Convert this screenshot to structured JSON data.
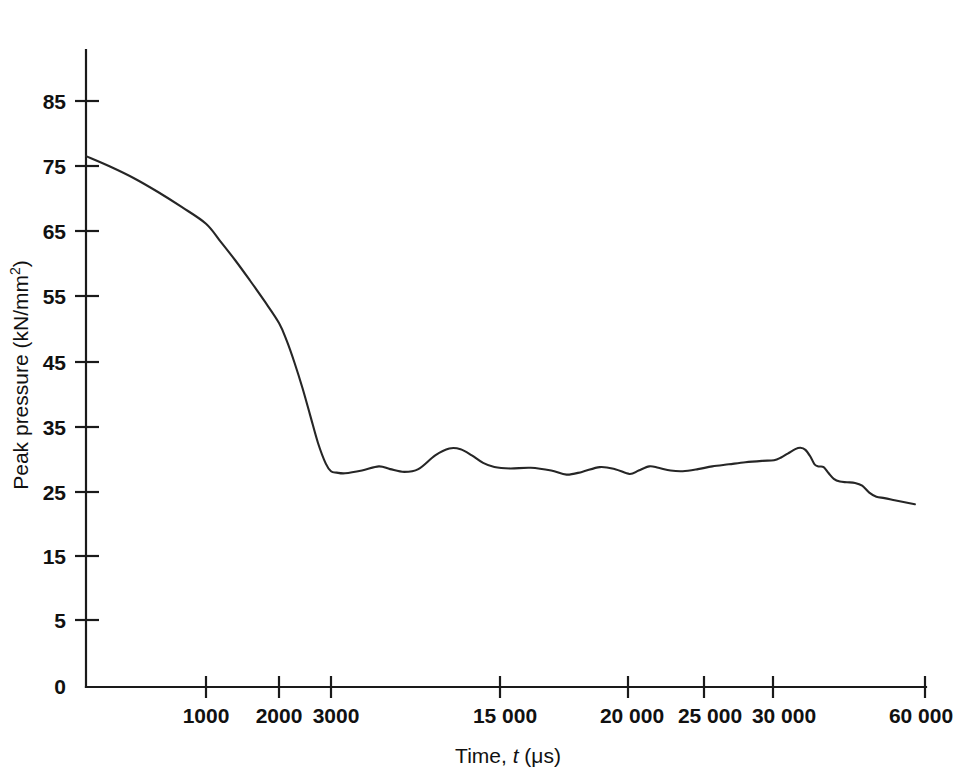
{
  "chart_data": {
    "type": "line",
    "title": "",
    "subtitle": "",
    "xlabel_plain": "Time, ",
    "xlabel_italic": "t",
    "xlabel_unit": " (μs)",
    "xlabel": "Time, t (μs)",
    "ylabel": "Peak pressure (kN/mm²)",
    "ylabel_main": "Peak pressure (kN/mm",
    "ylabel_sup": "2",
    "ylabel_close": ")",
    "grid": false,
    "legend": "none",
    "line_color": "#262626",
    "axis_color": "#1a1a1a",
    "background_color": "#ffffff",
    "xlim": [
      0,
      60000
    ],
    "ylim": [
      0,
      90
    ],
    "x_tick_values": [
      0,
      1000,
      2000,
      3000,
      15000,
      20000,
      25000,
      30000,
      60000
    ],
    "x_tick_labels": [
      "0",
      "1000",
      "2000",
      "3000",
      "15 000",
      "20 000",
      "25 000",
      "30 000",
      "60 000"
    ],
    "y_tick_values": [
      0,
      5,
      15,
      25,
      35,
      45,
      55,
      65,
      75,
      85
    ],
    "y_tick_labels": [
      "0",
      "5",
      "15",
      "25",
      "35",
      "45",
      "55",
      "65",
      "75",
      "85"
    ],
    "x_axis_scale": "piecewise-compressed",
    "series": [
      {
        "name": "Peak pressure decay",
        "points": [
          [
            0,
            77.0
          ],
          [
            200,
            75.5
          ],
          [
            400,
            73.8
          ],
          [
            600,
            71.8
          ],
          [
            800,
            69.6
          ],
          [
            1000,
            67.2
          ],
          [
            1200,
            64.6
          ],
          [
            1400,
            61.9
          ],
          [
            1600,
            59.0
          ],
          [
            1800,
            56.0
          ],
          [
            2000,
            52.8
          ],
          [
            2150,
            50.2
          ],
          [
            2300,
            47.0
          ],
          [
            2450,
            43.4
          ],
          [
            2600,
            39.4
          ],
          [
            2750,
            35.4
          ],
          [
            2900,
            32.4
          ],
          [
            3000,
            31.3
          ],
          [
            3400,
            31.1
          ],
          [
            4000,
            31.0
          ],
          [
            5200,
            31.4
          ],
          [
            6400,
            32.0
          ],
          [
            7200,
            31.6
          ],
          [
            8200,
            31.2
          ],
          [
            9200,
            31.6
          ],
          [
            10400,
            33.6
          ],
          [
            11400,
            34.6
          ],
          [
            12200,
            34.5
          ],
          [
            13000,
            33.6
          ],
          [
            13800,
            32.5
          ],
          [
            14600,
            31.9
          ],
          [
            15400,
            31.7
          ],
          [
            16200,
            31.8
          ],
          [
            17000,
            31.4
          ],
          [
            17600,
            30.8
          ],
          [
            18200,
            31.2
          ],
          [
            18900,
            31.9
          ],
          [
            19500,
            31.6
          ],
          [
            20100,
            30.9
          ],
          [
            20700,
            31.4
          ],
          [
            21400,
            32.0
          ],
          [
            22000,
            31.8
          ],
          [
            22800,
            31.4
          ],
          [
            23600,
            31.3
          ],
          [
            24600,
            31.6
          ],
          [
            25600,
            32.0
          ],
          [
            26800,
            32.3
          ],
          [
            28000,
            32.6
          ],
          [
            29200,
            32.8
          ],
          [
            30200,
            32.9
          ],
          [
            31600,
            33.3
          ],
          [
            33000,
            33.9
          ],
          [
            34400,
            34.5
          ],
          [
            35400,
            34.7
          ],
          [
            36400,
            34.4
          ],
          [
            37400,
            33.4
          ],
          [
            38200,
            32.3
          ],
          [
            39000,
            32.0
          ],
          [
            40000,
            31.9
          ],
          [
            41000,
            31.0
          ],
          [
            42000,
            30.2
          ],
          [
            43200,
            29.8
          ],
          [
            44600,
            29.7
          ],
          [
            46200,
            29.6
          ],
          [
            47600,
            29.2
          ],
          [
            49000,
            28.2
          ],
          [
            50400,
            27.6
          ],
          [
            52000,
            27.4
          ],
          [
            54000,
            27.1
          ],
          [
            56000,
            26.8
          ],
          [
            58000,
            26.5
          ]
        ]
      }
    ],
    "annotations": []
  }
}
